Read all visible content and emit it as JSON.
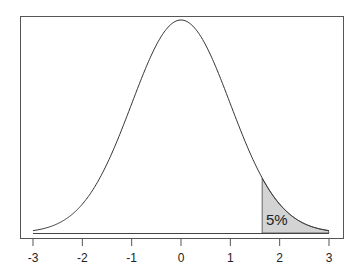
{
  "chart_data": {
    "type": "area",
    "title": "",
    "xlabel": "",
    "ylabel": "",
    "distribution": "standard normal",
    "x_ticks": [
      -3,
      -2,
      -1,
      0,
      1,
      2,
      3
    ],
    "x_tick_labels": [
      "-3",
      "-2",
      "-1",
      "0",
      "1",
      "2",
      "3"
    ],
    "xlim": [
      -3,
      3
    ],
    "y_axis_shown": false,
    "grid": false,
    "legend": null,
    "shaded_region": {
      "from": 1.645,
      "to": 3,
      "fill": "#d3d3d3",
      "label": "5%",
      "area": 0.05
    },
    "annotations": [
      {
        "text": "5%",
        "x": 2.0,
        "position": "inside shaded tail"
      }
    ],
    "curve_points": {
      "x": [
        -3,
        -2.5,
        -2,
        -1.5,
        -1,
        -0.5,
        0,
        0.5,
        1,
        1.5,
        1.645,
        2,
        2.5,
        3
      ],
      "y": [
        0.0044,
        0.0175,
        0.054,
        0.1295,
        0.242,
        0.3521,
        0.3989,
        0.3521,
        0.242,
        0.1295,
        0.1031,
        0.054,
        0.0175,
        0.0044
      ]
    }
  },
  "annotation": {
    "label": "5%"
  },
  "axis": {
    "ticks": [
      "-3",
      "-2",
      "-1",
      "0",
      "1",
      "2",
      "3"
    ]
  }
}
